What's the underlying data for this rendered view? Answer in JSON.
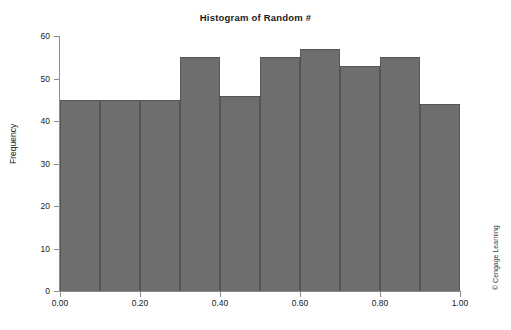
{
  "chart_data": {
    "type": "bar",
    "title": "Histogram of Random #",
    "xlabel": "",
    "ylabel": "Frequency",
    "xlim": [
      0.0,
      1.0
    ],
    "ylim": [
      0,
      60
    ],
    "grid": false,
    "legend": null,
    "bin_width": 0.1,
    "bin_edges": [
      0.0,
      0.1,
      0.2,
      0.3,
      0.4,
      0.5,
      0.6,
      0.7,
      0.8,
      0.9,
      1.0
    ],
    "categories": [
      "0.0-0.1",
      "0.1-0.2",
      "0.2-0.3",
      "0.3-0.4",
      "0.4-0.5",
      "0.5-0.6",
      "0.6-0.7",
      "0.7-0.8",
      "0.8-0.9",
      "0.9-1.0"
    ],
    "values": [
      45,
      45,
      45,
      55,
      46,
      55,
      57,
      53,
      55,
      44
    ],
    "y_ticks": [
      0,
      10,
      20,
      30,
      40,
      50,
      60
    ],
    "y_tick_labels": [
      "0",
      "10",
      "20",
      "30",
      "40",
      "50",
      "60"
    ],
    "x_ticks": [
      0.0,
      0.2,
      0.4,
      0.6,
      0.8,
      1.0
    ],
    "x_tick_labels": [
      "0.00",
      "0.20",
      "0.40",
      "0.60",
      "0.80",
      "1.00"
    ],
    "bar_color": "#6e6e6e",
    "bar_edge_color": "#555555",
    "axis_color": "#8c8c8c",
    "background": "#ffffff"
  },
  "annotations": {
    "copyright": "© Cengage Learning"
  }
}
